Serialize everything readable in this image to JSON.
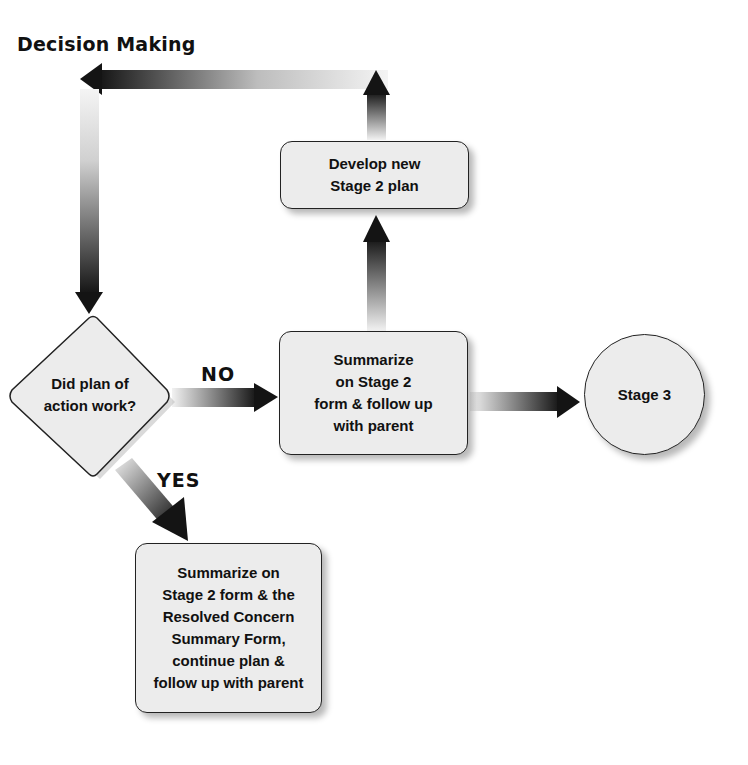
{
  "title": "Decision Making",
  "nodes": {
    "decision": {
      "text": "Did plan of\naction work?"
    },
    "develop": {
      "text": "Develop new\nStage 2 plan"
    },
    "summarize_no": {
      "text": "Summarize\non Stage 2\nform & follow up\nwith parent"
    },
    "stage3": {
      "text": "Stage 3"
    },
    "summarize_yes": {
      "text": "Summarize on\nStage 2 form & the\nResolved Concern\nSummary Form,\ncontinue plan &\nfollow up with parent"
    }
  },
  "edges": {
    "no_label": "NO",
    "yes_label": "YES"
  },
  "colors": {
    "node_fill": "#ececec",
    "node_border": "#222222",
    "arrow_dark": "#111111",
    "arrow_light": "#f2f2f2"
  }
}
